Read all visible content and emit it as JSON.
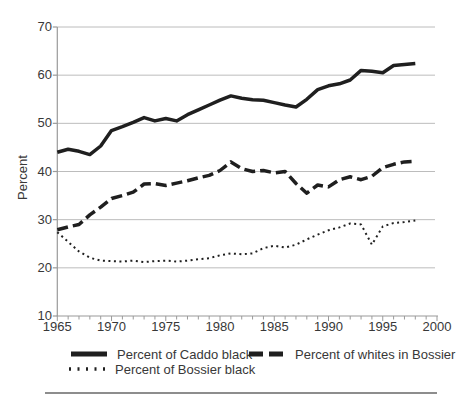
{
  "chart_data": {
    "type": "line",
    "title": "",
    "xlabel": "",
    "ylabel": "Percent",
    "xlim": [
      1965,
      2000
    ],
    "ylim": [
      10,
      70
    ],
    "xticks": [
      1965,
      1970,
      1975,
      1980,
      1985,
      1990,
      1995,
      2000
    ],
    "minor_xtick_step": 1,
    "yticks": [
      10,
      20,
      30,
      40,
      50,
      60,
      70
    ],
    "grid": "horizontal",
    "legend_position": "bottom",
    "colors": {
      "line": "#1f1f1f",
      "grid": "#bcbcbc",
      "axis": "#9a9a9a",
      "text": "#383838",
      "background": "#ffffff"
    },
    "x": [
      1965,
      1966,
      1967,
      1968,
      1969,
      1970,
      1971,
      1972,
      1973,
      1974,
      1975,
      1976,
      1977,
      1978,
      1979,
      1980,
      1981,
      1982,
      1983,
      1984,
      1985,
      1986,
      1987,
      1988,
      1989,
      1990,
      1991,
      1992,
      1993,
      1994,
      1995,
      1996,
      1997,
      1998
    ],
    "series": [
      {
        "name": "Percent of Caddo black",
        "style": "solid",
        "values": [
          44.0,
          44.6,
          44.2,
          43.5,
          45.3,
          48.5,
          49.3,
          50.2,
          51.2,
          50.5,
          51.0,
          50.5,
          51.8,
          52.8,
          53.8,
          54.8,
          55.7,
          55.2,
          54.9,
          54.8,
          54.3,
          53.8,
          53.4,
          55.0,
          57.0,
          57.8,
          58.2,
          59.0,
          61.0,
          60.8,
          60.5,
          62.0,
          62.2,
          62.4
        ]
      },
      {
        "name": "Percent of whites in Bossier",
        "style": "dashed",
        "values": [
          27.9,
          28.5,
          29.0,
          31.0,
          32.6,
          34.4,
          35.0,
          35.7,
          37.4,
          37.5,
          37.1,
          37.6,
          38.1,
          38.7,
          39.2,
          40.2,
          42.0,
          40.6,
          40.0,
          40.2,
          39.7,
          40.0,
          37.5,
          35.5,
          37.2,
          36.8,
          38.3,
          38.9,
          38.3,
          39.0,
          40.8,
          41.5,
          42.0,
          42.1
        ]
      },
      {
        "name": "Percent of Bossier black",
        "style": "dotted",
        "values": [
          27.4,
          25.4,
          23.4,
          22.1,
          21.5,
          21.4,
          21.3,
          21.5,
          21.2,
          21.4,
          21.5,
          21.3,
          21.5,
          21.8,
          22.0,
          22.6,
          23.0,
          22.8,
          23.0,
          24.1,
          24.6,
          24.2,
          24.8,
          25.9,
          26.9,
          27.8,
          28.4,
          29.2,
          29.0,
          24.8,
          28.6,
          29.3,
          29.5,
          29.8
        ]
      }
    ]
  }
}
